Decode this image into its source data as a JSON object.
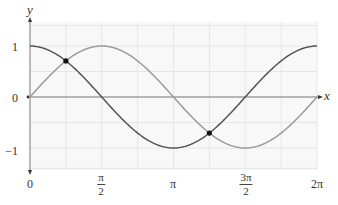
{
  "chart_data": {
    "type": "line",
    "title": "",
    "xlabel": "x",
    "ylabel": "y",
    "xlim": [
      0,
      6.2832
    ],
    "ylim": [
      -1.45,
      1.45
    ],
    "grid": true,
    "grid_x_step": "π/4",
    "grid_y_step": 0.5,
    "x_ticks": [
      {
        "value": 0,
        "label": "0"
      },
      {
        "value": 1.5708,
        "label_num": "π",
        "label_den": "2"
      },
      {
        "value": 3.1416,
        "label": "π"
      },
      {
        "value": 4.7124,
        "label_num": "3π",
        "label_den": "2"
      },
      {
        "value": 6.2832,
        "label": "2π"
      }
    ],
    "y_ticks": [
      {
        "value": 1,
        "label": "1"
      },
      {
        "value": 0,
        "label": "0"
      },
      {
        "value": -1,
        "label": "−1"
      }
    ],
    "series": [
      {
        "name": "cos x",
        "function": "cos",
        "color": "#555555",
        "x": [
          0,
          0.7854,
          1.5708,
          2.3562,
          3.1416,
          3.927,
          4.7124,
          5.4978,
          6.2832
        ],
        "values": [
          1,
          0.707,
          0,
          -0.707,
          -1,
          -0.707,
          0,
          0.707,
          1
        ]
      },
      {
        "name": "sin x",
        "function": "sin",
        "color": "#9a9a9a",
        "x": [
          0,
          0.7854,
          1.5708,
          2.3562,
          3.1416,
          3.927,
          4.7124,
          5.4978,
          6.2832
        ],
        "values": [
          0,
          0.707,
          1,
          0.707,
          0,
          -0.707,
          -1,
          -0.707,
          0
        ]
      }
    ],
    "annotations": [
      {
        "type": "point",
        "x": 0.7854,
        "y": 0.707,
        "label": "intersection at π/4"
      },
      {
        "type": "point",
        "x": 3.927,
        "y": -0.707,
        "label": "intersection at 5π/4"
      }
    ],
    "legend": "none"
  },
  "axes": {
    "x_name": "x",
    "y_name": "y"
  },
  "ticks": {
    "y1": "1",
    "y0": "0",
    "yneg1": "−1",
    "x0": "0",
    "x_half_pi_num": "π",
    "x_half_pi_den": "2",
    "x_pi": "π",
    "x_three_half_pi_num": "3π",
    "x_three_half_pi_den": "2",
    "x_two_pi": "2π"
  },
  "colors": {
    "cos": "#555555",
    "sin": "#9a9a9a",
    "axis": "#666666",
    "grid": "#e6e6e6",
    "grid_bg": "#f7f7f7"
  }
}
